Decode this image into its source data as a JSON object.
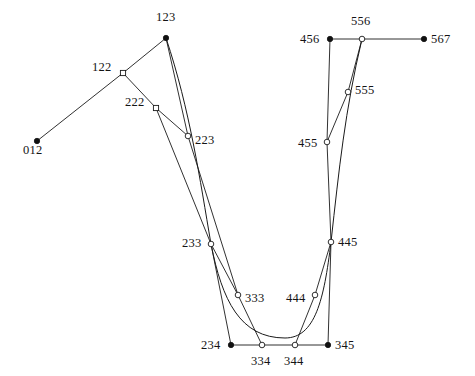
{
  "figure": {
    "width": 475,
    "height": 376,
    "background_color": "#ffffff",
    "line_color": "#1a1a1a",
    "label_color": "#141414"
  },
  "chart_data": {
    "type": "scatter",
    "title": "",
    "xlabel": "",
    "ylabel": "",
    "xlim": [
      0,
      475
    ],
    "ylim": [
      376,
      0
    ],
    "grid": false,
    "legend": null,
    "points": [
      {
        "label": "012",
        "x": 37,
        "y": 141,
        "marker": "filled-circle",
        "label_dx": -14,
        "label_dy": 9
      },
      {
        "label": "122",
        "x": 123,
        "y": 73,
        "marker": "square",
        "label_dx": -31,
        "label_dy": -6
      },
      {
        "label": "123",
        "x": 166,
        "y": 38,
        "marker": "filled-circle",
        "label_dx": -10,
        "label_dy": -21
      },
      {
        "label": "222",
        "x": 156,
        "y": 108,
        "marker": "square",
        "label_dx": -31,
        "label_dy": -6
      },
      {
        "label": "223",
        "x": 188,
        "y": 136,
        "marker": "hollow-circle",
        "label_dx": 7,
        "label_dy": 4
      },
      {
        "label": "233",
        "x": 211,
        "y": 244,
        "marker": "hollow-circle",
        "label_dx": -29,
        "label_dy": -1
      },
      {
        "label": "333",
        "x": 238,
        "y": 295,
        "marker": "hollow-circle",
        "label_dx": 7,
        "label_dy": 3
      },
      {
        "label": "234",
        "x": 231,
        "y": 345,
        "marker": "filled-circle",
        "label_dx": -30,
        "label_dy": 0
      },
      {
        "label": "334",
        "x": 262,
        "y": 345,
        "marker": "hollow-circle",
        "label_dx": -11,
        "label_dy": 16
      },
      {
        "label": "344",
        "x": 295,
        "y": 345,
        "marker": "hollow-circle",
        "label_dx": -11,
        "label_dy": 16
      },
      {
        "label": "345",
        "x": 328,
        "y": 345,
        "marker": "filled-circle",
        "label_dx": 7,
        "label_dy": 0
      },
      {
        "label": "444",
        "x": 315,
        "y": 295,
        "marker": "hollow-circle",
        "label_dx": -29,
        "label_dy": 3
      },
      {
        "label": "445",
        "x": 331,
        "y": 242,
        "marker": "hollow-circle",
        "label_dx": 7,
        "label_dy": 0
      },
      {
        "label": "455",
        "x": 327,
        "y": 142,
        "marker": "hollow-circle",
        "label_dx": -29,
        "label_dy": 1
      },
      {
        "label": "555",
        "x": 348,
        "y": 92,
        "marker": "hollow-circle",
        "label_dx": 7,
        "label_dy": -2
      },
      {
        "label": "456",
        "x": 330,
        "y": 39,
        "marker": "filled-circle",
        "label_dx": -30,
        "label_dy": 0
      },
      {
        "label": "556",
        "x": 362,
        "y": 39,
        "marker": "hollow-circle",
        "label_dx": -11,
        "label_dy": -18
      },
      {
        "label": "567",
        "x": 424,
        "y": 39,
        "marker": "filled-circle",
        "label_dx": 7,
        "label_dy": 0
      }
    ],
    "segments": [
      {
        "name": "012-122",
        "from": "012",
        "to": "122"
      },
      {
        "name": "122-123",
        "from": "122",
        "to": "123"
      },
      {
        "name": "123-223",
        "from": "123",
        "to": "223"
      },
      {
        "name": "122-222",
        "from": "122",
        "to": "222"
      },
      {
        "name": "222-223",
        "from": "222",
        "to": "223"
      },
      {
        "name": "222-233",
        "from": "222",
        "to": "233"
      },
      {
        "name": "223-333",
        "from": "223",
        "to": "333"
      },
      {
        "name": "233-234",
        "from": "233",
        "to": "234"
      },
      {
        "name": "233-333",
        "from": "233",
        "to": "333"
      },
      {
        "name": "333-334",
        "from": "333",
        "to": "334"
      },
      {
        "name": "234-345",
        "from": "234",
        "to": "345"
      },
      {
        "name": "344-444",
        "from": "344",
        "to": "444"
      },
      {
        "name": "444-445",
        "from": "444",
        "to": "445"
      },
      {
        "name": "445-345",
        "from": "445",
        "to": "345"
      },
      {
        "name": "445-455",
        "from": "445",
        "to": "455"
      },
      {
        "name": "455-456",
        "from": "455",
        "to": "456"
      },
      {
        "name": "455-555",
        "from": "455",
        "to": "555"
      },
      {
        "name": "555-556",
        "from": "555",
        "to": "556"
      },
      {
        "name": "456-567",
        "from": "456",
        "to": "567"
      }
    ],
    "curve": {
      "name": "bezier-curve",
      "path": "M 166 38 C 190 110 200 180 211 244 C 222 300 240 338 285 338 C 315 338 324 300 331 242 C 339 170 345 110 362 39"
    }
  }
}
